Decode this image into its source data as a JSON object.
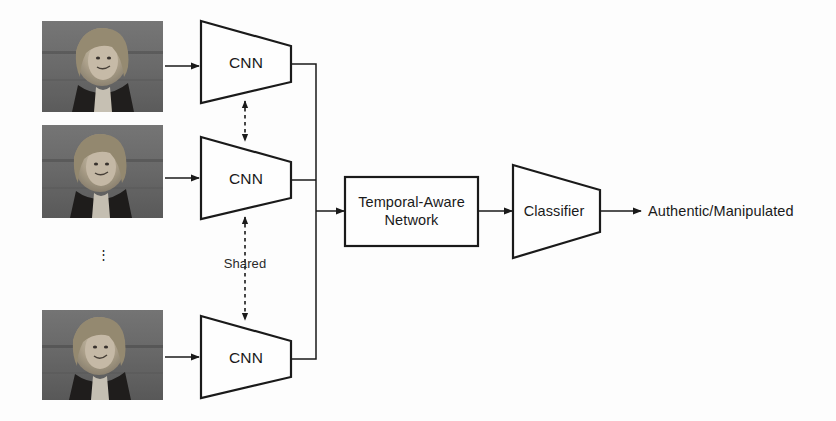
{
  "figure": {
    "type": "architecture-diagram",
    "background_color": "#fdfdfd",
    "stroke_color": "#1a1a1a",
    "title": ""
  },
  "inputs": {
    "frames": [
      {
        "name": "video-frame-1",
        "alt": "grayscale video frame of a woman in a dark jacket"
      },
      {
        "name": "video-frame-2",
        "alt": "grayscale video frame of a woman in a dark jacket"
      },
      {
        "name": "video-frame-n",
        "alt": "grayscale video frame of a woman in a dark jacket"
      }
    ],
    "ellipsis": "⋮"
  },
  "encoders": {
    "blocks": [
      {
        "label": "CNN"
      },
      {
        "label": "CNN"
      },
      {
        "label": "CNN"
      }
    ],
    "shared_label": "Shared"
  },
  "temporal": {
    "label": "Temporal-Aware\nNetwork"
  },
  "classifier": {
    "label": "Classifier"
  },
  "output": {
    "label": "Authentic/Manipulated"
  }
}
